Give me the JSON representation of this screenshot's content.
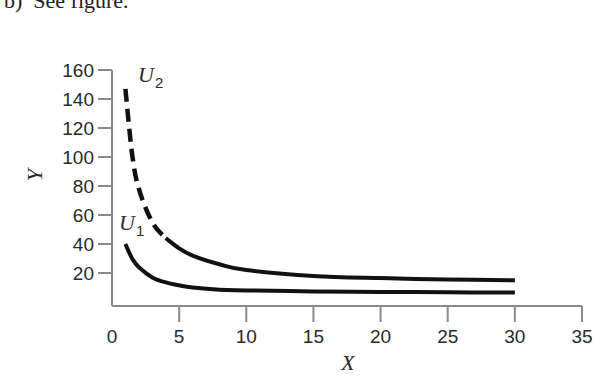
{
  "caption": "b)  See figure.",
  "chart_data": {
    "type": "line",
    "title": "",
    "xlabel": "X",
    "ylabel": "Y",
    "xlim": [
      0,
      35
    ],
    "ylim": [
      0,
      160
    ],
    "x_ticks": [
      0,
      5,
      10,
      15,
      20,
      25,
      30,
      35
    ],
    "y_ticks": [
      20,
      40,
      60,
      80,
      100,
      120,
      140,
      160
    ],
    "grid": false,
    "legend": "none (curves labeled inline)",
    "series": [
      {
        "name": "U2",
        "label_main": "U",
        "label_sub": "2",
        "style": "dashed for x < 4, solid for x >= 4",
        "x": [
          1,
          1.5,
          2,
          3,
          4,
          5,
          6,
          8,
          10,
          15,
          20,
          25,
          30
        ],
        "y": [
          147,
          102,
          78,
          55,
          44,
          37,
          32,
          26,
          22,
          18,
          16.5,
          15.5,
          15
        ]
      },
      {
        "name": "U1",
        "label_main": "U",
        "label_sub": "1",
        "style": "solid",
        "x": [
          1,
          1.5,
          2,
          3,
          4,
          5,
          6,
          8,
          10,
          15,
          20,
          25,
          30
        ],
        "y": [
          40,
          30,
          24,
          17,
          13.5,
          11.5,
          10,
          8.5,
          8,
          7.3,
          7,
          6.7,
          6.5
        ]
      }
    ]
  }
}
